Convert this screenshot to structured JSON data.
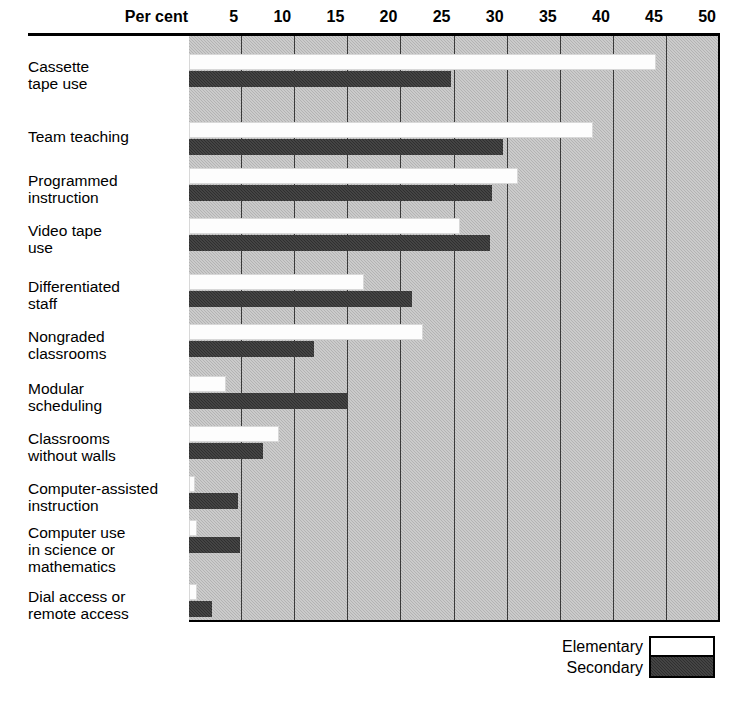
{
  "chart_data": {
    "type": "bar",
    "title": "",
    "orientation": "horizontal",
    "xlabel": "Per cent",
    "ylabel": "",
    "xlim": [
      0,
      50
    ],
    "xticks": [
      5,
      10,
      15,
      20,
      25,
      30,
      35,
      40,
      45,
      50
    ],
    "grid": true,
    "legend_position": "bottom-right",
    "categories": [
      "Cassette tape use",
      "Team teaching",
      "Programmed instruction",
      "Video tape use",
      "Differentiated staff",
      "Nongraded classrooms",
      "Modular scheduling",
      "Classrooms without walls",
      "Computer-assisted instruction",
      "Computer use in science or mathematics",
      "Dial access or remote access"
    ],
    "series": [
      {
        "name": "Elementary",
        "color": "#ffffff",
        "values": [
          44.0,
          38.0,
          31.0,
          25.5,
          16.5,
          22.0,
          3.5,
          8.5,
          0.6,
          0.8,
          0.8
        ]
      },
      {
        "name": "Secondary",
        "color": "#2f2f2f",
        "values": [
          24.7,
          29.6,
          28.5,
          28.3,
          21.0,
          11.8,
          15.0,
          7.0,
          4.6,
          4.8,
          2.2
        ]
      }
    ]
  },
  "axis": {
    "percent_label": "Per cent",
    "ticks": [
      "5",
      "10",
      "15",
      "20",
      "25",
      "30",
      "35",
      "40",
      "45",
      "50"
    ]
  },
  "categories": [
    {
      "lines": [
        "Cassette",
        "tape use"
      ]
    },
    {
      "lines": [
        "Team teaching"
      ]
    },
    {
      "lines": [
        "Programmed",
        "instruction"
      ]
    },
    {
      "lines": [
        "Video tape",
        "use"
      ]
    },
    {
      "lines": [
        "Differentiated",
        "staff"
      ]
    },
    {
      "lines": [
        "Nongraded",
        "classrooms"
      ]
    },
    {
      "lines": [
        "Modular",
        "scheduling"
      ]
    },
    {
      "lines": [
        "Classrooms",
        "without walls"
      ]
    },
    {
      "lines": [
        "Computer-assisted",
        "instruction"
      ]
    },
    {
      "lines": [
        "Computer use",
        "in science or",
        "mathematics"
      ]
    },
    {
      "lines": [
        "Dial access or",
        "remote access"
      ]
    }
  ],
  "legend": {
    "elementary_label": "Elementary",
    "secondary_label": "Secondary"
  },
  "colors": {
    "plot_background": "#b3b3b3",
    "elementary_bar": "#ffffff",
    "secondary_bar": "#2f2f2f",
    "gridline": "#3a3a3a",
    "axis_rule": "#000000"
  }
}
